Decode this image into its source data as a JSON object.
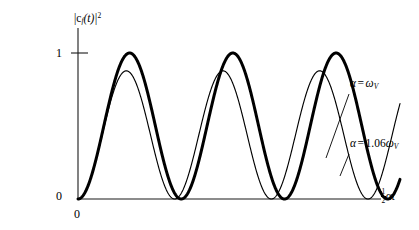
{
  "figure": {
    "title": "",
    "background_color": "#ffffff",
    "ink_color": "#000000"
  },
  "axes": {
    "y_axis_label": "|c",
    "y_axis_label_sub": "f",
    "y_axis_label_arg": "(t)|",
    "y_axis_label_sup": "2",
    "y_ticks": [
      "1",
      "0"
    ],
    "y_tick_one": "1",
    "y_tick_zero": "0",
    "x_origin_label": "0",
    "x_axis_label_frac_num": "1",
    "x_axis_label_frac_den": "2",
    "x_axis_label_symbol": "αt"
  },
  "annotations": {
    "upper": {
      "alpha": "α",
      "equals": "=",
      "value": "ω",
      "subscript": "V"
    },
    "lower": {
      "alpha": "α",
      "equals": "=",
      "coefficient": "1.06",
      "value": "ω",
      "subscript": "V"
    }
  },
  "chart_data": {
    "type": "line",
    "title": "",
    "xlabel": "½αt",
    "ylabel": "|c_f(t)|^2",
    "xlim": [
      0,
      9.8
    ],
    "ylim": [
      0,
      1.12
    ],
    "grid": false,
    "legend_position": "right-inline-annotations",
    "x_tick_labels": [
      "0"
    ],
    "y_tick_labels": [
      "0",
      "1"
    ],
    "y_tick_values": [
      0,
      1
    ],
    "series": [
      {
        "name": "α = ω_V",
        "line_style": "thick",
        "stroke_width": 3.0,
        "color": "#000000",
        "amplitude": 1.0,
        "form": "sin^2(x)",
        "period_in_x": 3.1416,
        "peak_value": 1.0,
        "peaks_x": [
          1.571,
          4.712,
          7.854
        ],
        "zeros_x": [
          0,
          3.1416,
          6.2832,
          9.4248
        ],
        "x": [
          0,
          0.39,
          0.79,
          1.18,
          1.57,
          1.96,
          2.36,
          2.75,
          3.14,
          3.53,
          3.93,
          4.32,
          4.71,
          5.11,
          5.5,
          5.89,
          6.28,
          6.68,
          7.07,
          7.46,
          7.85,
          8.25,
          8.64,
          9.03,
          9.42,
          9.8
        ],
        "y": [
          0,
          0.146,
          0.5,
          0.854,
          1.0,
          0.854,
          0.5,
          0.146,
          0,
          0.146,
          0.5,
          0.854,
          1.0,
          0.854,
          0.5,
          0.146,
          0,
          0.146,
          0.5,
          0.854,
          1.0,
          0.854,
          0.5,
          0.146,
          0,
          0.132
        ]
      },
      {
        "name": "α = 1.06ω_V",
        "line_style": "thin",
        "stroke_width": 1.15,
        "color": "#000000",
        "amplitude": 0.878,
        "form": "A*sin^2(k*x)",
        "frequency_ratio": 1.068,
        "period_in_x": 2.942,
        "peak_value": 0.878,
        "peaks_x": [
          1.471,
          4.413,
          7.355
        ],
        "zeros_x": [
          0,
          2.942,
          5.884,
          8.826
        ],
        "x": [
          0,
          0.37,
          0.74,
          1.1,
          1.47,
          1.84,
          2.21,
          2.57,
          2.94,
          3.31,
          3.68,
          4.05,
          4.41,
          4.78,
          5.15,
          5.52,
          5.88,
          6.25,
          6.62,
          6.99,
          7.36,
          7.72,
          8.09,
          8.46,
          8.83,
          9.2,
          9.56,
          9.8
        ],
        "y": [
          0,
          0.128,
          0.439,
          0.75,
          0.878,
          0.75,
          0.439,
          0.128,
          0,
          0.128,
          0.439,
          0.75,
          0.878,
          0.75,
          0.439,
          0.128,
          0,
          0.128,
          0.439,
          0.75,
          0.878,
          0.75,
          0.439,
          0.128,
          0,
          0.128,
          0.41,
          0.63
        ]
      }
    ]
  }
}
